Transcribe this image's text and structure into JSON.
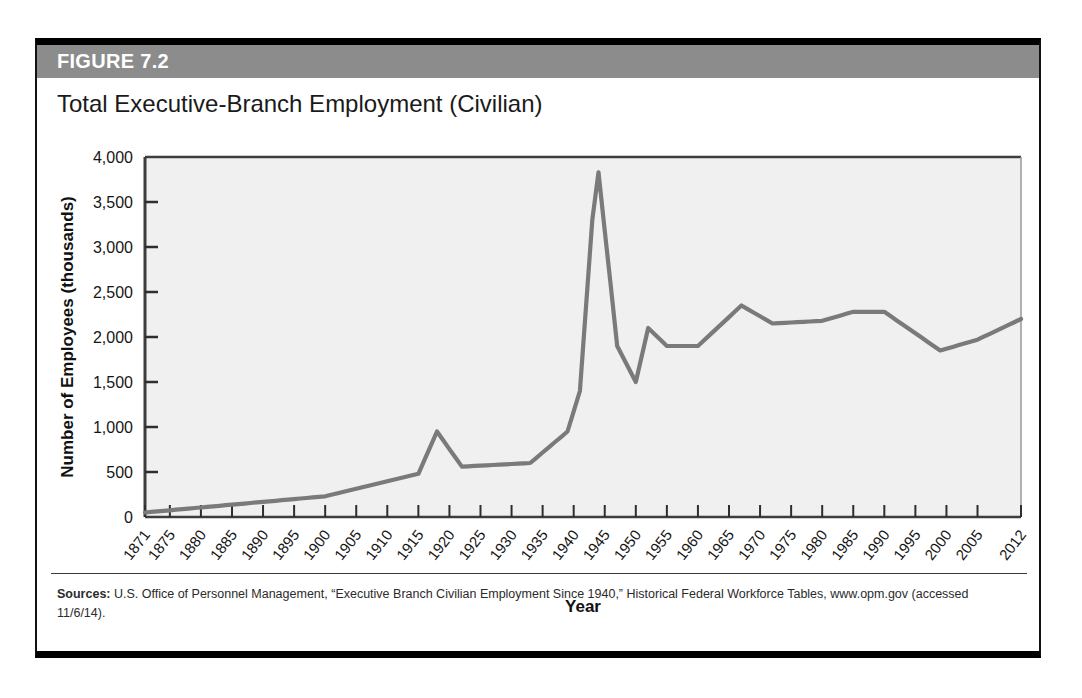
{
  "figure": {
    "label": "FIGURE 7.2",
    "title": "Total Executive-Branch Employment (Civilian)",
    "header_color": "#8c8c8c",
    "line_color": "#7a7a7a",
    "plot_background": "#f0f0f0",
    "source_prefix": "Sources:",
    "source_text": " U.S. Office of Personnel Management, “Executive Branch Civilian Employment Since 1940,” Historical Federal Workforce Tables, www.opm.gov (accessed 11/6/14)."
  },
  "chart_data": {
    "type": "line",
    "title": "Total Executive-Branch Employment (Civilian)",
    "xlabel": "Year",
    "ylabel": "Number of Employees (thousands)",
    "xlim": [
      1871,
      2012
    ],
    "ylim": [
      0,
      4000
    ],
    "ytick_values": [
      0,
      500,
      1000,
      1500,
      2000,
      2500,
      3000,
      3500,
      4000
    ],
    "ytick_labels": [
      "0",
      "500",
      "1,000",
      "1,500",
      "2,000",
      "2,500",
      "3,000",
      "3,500",
      "4,000"
    ],
    "xtick_labels": [
      "1871",
      "1875",
      "1880",
      "1885",
      "1890",
      "1895",
      "1900",
      "1905",
      "1910",
      "1915",
      "1920",
      "1925",
      "1930",
      "1935",
      "1940",
      "1945",
      "1950",
      "1955",
      "1960",
      "1965",
      "1970",
      "1975",
      "1980",
      "1985",
      "1990",
      "1995",
      "2000",
      "2005",
      "2012"
    ],
    "xtick_values": [
      1871,
      1875,
      1880,
      1885,
      1890,
      1895,
      1900,
      1905,
      1910,
      1915,
      1920,
      1925,
      1930,
      1935,
      1940,
      1945,
      1950,
      1955,
      1960,
      1965,
      1970,
      1975,
      1980,
      1985,
      1990,
      1995,
      2000,
      2005,
      2012
    ],
    "grid": false,
    "legend": "none",
    "series": [
      {
        "name": "Executive-Branch Civilian Employment",
        "x": [
          1871,
          1875,
          1880,
          1885,
          1890,
          1895,
          1900,
          1903,
          1905,
          1908,
          1910,
          1912,
          1914,
          1915,
          1916,
          1917,
          1918,
          1919,
          1920,
          1921,
          1922,
          1923,
          1925,
          1927,
          1929,
          1931,
          1933,
          1934,
          1935,
          1936,
          1937,
          1938,
          1939,
          1940,
          1941,
          1942,
          1943,
          1944,
          1945,
          1946,
          1947,
          1948,
          1949,
          1950,
          1951,
          1952,
          1953,
          1954,
          1955,
          1956,
          1957,
          1958,
          1959,
          1960,
          1962,
          1964,
          1966,
          1967,
          1968,
          1969,
          1970,
          1971,
          1972,
          1973,
          1974,
          1975,
          1976,
          1977,
          1978,
          1979,
          1980,
          1981,
          1982,
          1983,
          1984,
          1985,
          1986,
          1987,
          1988,
          1989,
          1990,
          1991,
          1992,
          1993,
          1994,
          1995,
          1996,
          1997,
          1998,
          1999,
          2000,
          2001,
          2002,
          2003,
          2004,
          2005,
          2006,
          2007,
          2008,
          2009,
          2010,
          2011,
          2012
        ],
        "y": [
          51,
          90,
          100,
          120,
          157,
          196,
          208,
          260,
          270,
          310,
          360,
          396,
          402,
          430,
          450,
          600,
          950,
          794,
          655,
          561,
          543,
          536,
          553,
          548,
          560,
          596,
          604,
          698,
          698,
          824,
          861,
          882,
          954,
          1042,
          1438,
          2296,
          3270,
          3304,
          3816,
          2696,
          2111,
          2071,
          2102,
          1960,
          2482,
          2600,
          2558,
          2407,
          2397,
          2398,
          2439,
          2382,
          2383,
          2399,
          2485,
          2470,
          2726,
          2877,
          2951,
          2969,
          2944,
          2883,
          2823,
          2781,
          2847,
          2848,
          2842,
          2727,
          2753,
          2823,
          2821,
          2806,
          2770,
          2820,
          2942,
          2964,
          2899,
          3029,
          3054,
          3064,
          3067,
          3048,
          3017,
          2915,
          2908,
          2858,
          2786,
          2727,
          2700,
          2687,
          2639,
          2640,
          2630,
          2660,
          2650,
          2660,
          2700,
          2720,
          2760,
          2774,
          2776,
          2800,
          2804
        ]
      }
    ],
    "approximate_plot_values": {
      "note": "Curve traced from the plotted line in thousands of employees",
      "key_points": [
        {
          "year": 1871,
          "value": 50
        },
        {
          "year": 1900,
          "value": 230
        },
        {
          "year": 1915,
          "value": 480
        },
        {
          "year": 1918,
          "value": 950
        },
        {
          "year": 1922,
          "value": 560
        },
        {
          "year": 1933,
          "value": 600
        },
        {
          "year": 1939,
          "value": 950
        },
        {
          "year": 1941,
          "value": 1400
        },
        {
          "year": 1943,
          "value": 3300
        },
        {
          "year": 1944,
          "value": 3830
        },
        {
          "year": 1947,
          "value": 1900
        },
        {
          "year": 1950,
          "value": 1500
        },
        {
          "year": 1952,
          "value": 2100
        },
        {
          "year": 1955,
          "value": 1900
        },
        {
          "year": 1960,
          "value": 1900
        },
        {
          "year": 1967,
          "value": 2350
        },
        {
          "year": 1972,
          "value": 2150
        },
        {
          "year": 1980,
          "value": 2180
        },
        {
          "year": 1985,
          "value": 2280
        },
        {
          "year": 1990,
          "value": 2280
        },
        {
          "year": 1999,
          "value": 1850
        },
        {
          "year": 2005,
          "value": 1970
        },
        {
          "year": 2012,
          "value": 2200
        }
      ]
    }
  }
}
